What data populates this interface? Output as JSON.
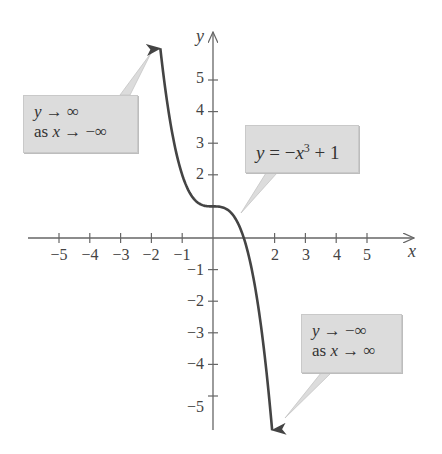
{
  "chart_data": {
    "type": "line",
    "title": "",
    "function": "y = -x^3 + 1",
    "xlabel": "x",
    "ylabel": "y",
    "xlim": [
      -6,
      6.5
    ],
    "ylim": [
      -6.2,
      6.5
    ],
    "grid": false,
    "x_ticks": [
      -5,
      -4,
      -3,
      -2,
      -1,
      2,
      3,
      4,
      5
    ],
    "y_ticks": [
      5,
      4,
      3,
      2,
      -1,
      -2,
      -3,
      -4,
      -5
    ],
    "series": [
      {
        "name": "y = -x^3 + 1",
        "color": "#444444",
        "x": [
          -1.71,
          -1.5,
          -1.25,
          -1.0,
          -0.75,
          -0.5,
          -0.25,
          0,
          0.25,
          0.5,
          0.75,
          1.0,
          1.25,
          1.5,
          1.75,
          1.92
        ],
        "y": [
          6.0,
          4.375,
          2.953,
          2.0,
          1.422,
          1.125,
          1.016,
          1.0,
          0.984,
          0.875,
          0.578,
          0.0,
          -0.953,
          -2.375,
          -4.359,
          -6.08
        ]
      }
    ],
    "annotations": [
      {
        "id": "left-end",
        "lines": [
          "y → ∞",
          "as x → −∞"
        ]
      },
      {
        "id": "equation",
        "lines": [
          "y = −x³ + 1"
        ]
      },
      {
        "id": "right-end",
        "lines": [
          "y → −∞",
          "as x → ∞"
        ]
      }
    ]
  },
  "labels": {
    "x_axis": "x",
    "y_axis": "y",
    "x_ticks": [
      "−5",
      "−4",
      "−3",
      "−2",
      "−1",
      "2",
      "3",
      "4",
      "5"
    ],
    "y_ticks_pos": [
      "5",
      "4",
      "3",
      "2"
    ],
    "y_ticks_neg": [
      "−1",
      "−2",
      "−3",
      "−4",
      "−5"
    ]
  },
  "callouts": {
    "left": {
      "line1_var": "y",
      "line1_rest": " → ∞",
      "line2_pre": "as ",
      "line2_var": "x",
      "line2_rest": " → −∞"
    },
    "equation": {
      "var_y": "y",
      "eq": " = −",
      "var_x": "x",
      "exp": "3",
      "rest": " + 1"
    },
    "right": {
      "line1_var": "y",
      "line1_rest": " → −∞",
      "line2_pre": "as ",
      "line2_var": "x",
      "line2_rest": " → ∞"
    }
  },
  "colors": {
    "axis": "#666666",
    "curve": "#444444",
    "callout_bg": "#dcdcdc"
  }
}
